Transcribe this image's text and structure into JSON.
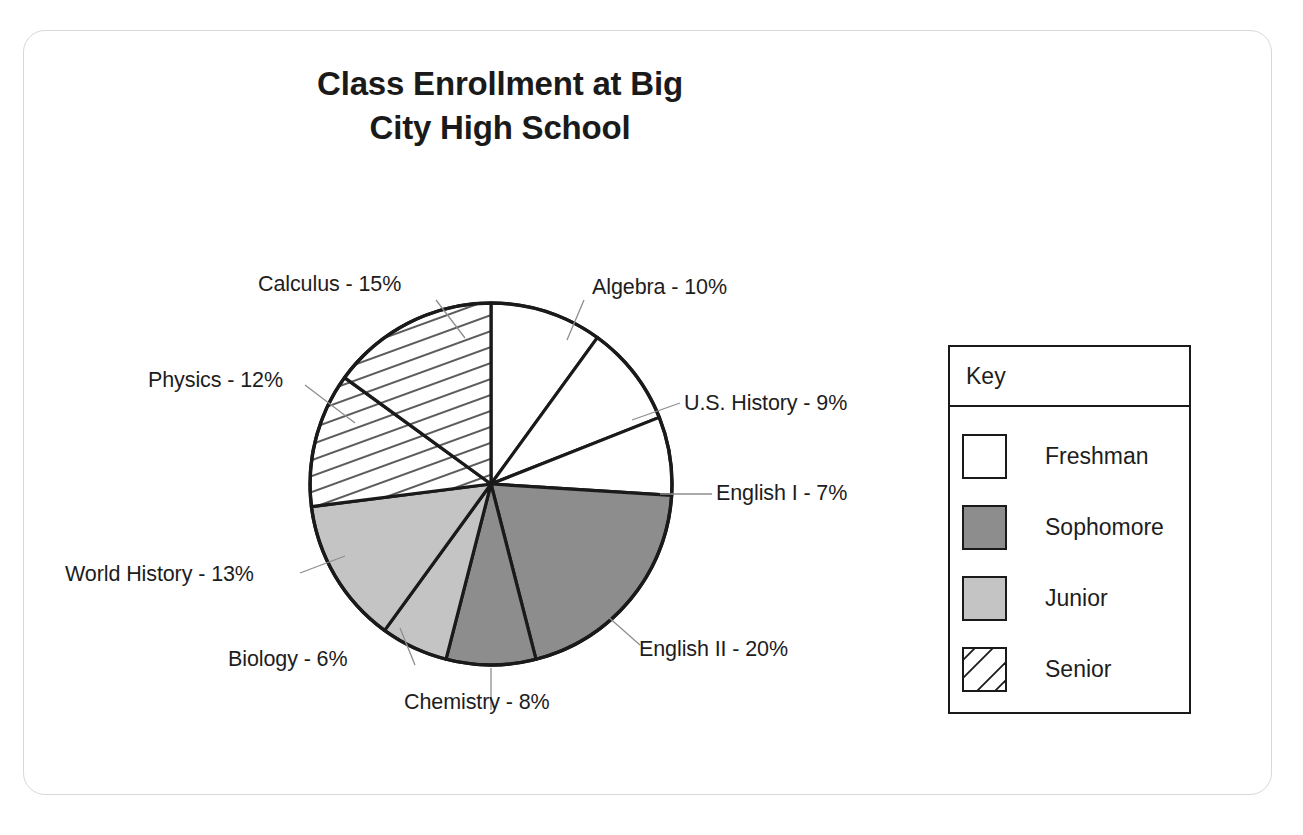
{
  "chart_data": {
    "type": "pie",
    "title": "Class Enrollment at Big\nCity High School",
    "title_line1": "Class Enrollment at Big",
    "title_line2": "City High School",
    "xlabel": "",
    "ylabel": "",
    "legend_position": "right",
    "grid": false,
    "units": "percent",
    "categories": [
      "Algebra",
      "U.S. History",
      "English I",
      "English II",
      "Chemistry",
      "Biology",
      "World History",
      "Physics",
      "Calculus"
    ],
    "values": [
      10,
      9,
      7,
      20,
      8,
      6,
      13,
      12,
      15
    ],
    "labels": [
      "Algebra - 10%",
      "U.S. History - 9%",
      "English I - 7%",
      "English II - 20%",
      "Chemistry - 8%",
      "Biology - 6%",
      "World History - 13%",
      "Physics - 12%",
      "Calculus - 15%"
    ],
    "slices": [
      {
        "name": "Algebra",
        "label": "Algebra - 10%",
        "value": 10,
        "group": "Freshman",
        "fill": "#ffffff"
      },
      {
        "name": "U.S. History",
        "label": "U.S. History - 9%",
        "value": 9,
        "group": "Freshman",
        "fill": "#ffffff"
      },
      {
        "name": "English I",
        "label": "English I - 7%",
        "value": 7,
        "group": "Freshman",
        "fill": "#ffffff"
      },
      {
        "name": "English II",
        "label": "English II - 20%",
        "value": 20,
        "group": "Sophomore",
        "fill": "#8d8d8d"
      },
      {
        "name": "Chemistry",
        "label": "Chemistry - 8%",
        "value": 8,
        "group": "Sophomore",
        "fill": "#8d8d8d"
      },
      {
        "name": "Biology",
        "label": "Biology - 6%",
        "value": 6,
        "group": "Junior",
        "fill": "#c4c4c4"
      },
      {
        "name": "World History",
        "label": "World History - 13%",
        "value": 13,
        "group": "Junior",
        "fill": "#c4c4c4"
      },
      {
        "name": "Physics",
        "label": "Physics - 12%",
        "value": 12,
        "group": "Senior",
        "fill": "hatch"
      },
      {
        "name": "Calculus",
        "label": "Calculus - 15%",
        "value": 15,
        "group": "Senior",
        "fill": "hatch"
      }
    ],
    "legend": [
      {
        "label": "Freshman",
        "swatch": "white"
      },
      {
        "label": "Sophomore",
        "swatch": "dark-gray"
      },
      {
        "label": "Junior",
        "swatch": "light-gray"
      },
      {
        "label": "Senior",
        "swatch": "diagonal-hatch"
      }
    ]
  },
  "key": {
    "header": "Key",
    "items": [
      {
        "label": "Freshman"
      },
      {
        "label": "Sophomore"
      },
      {
        "label": "Junior"
      },
      {
        "label": "Senior"
      }
    ]
  },
  "colors": {
    "freshman": "#ffffff",
    "sophomore": "#8d8d8d",
    "junior": "#c4c4c4",
    "senior": "#ffffff",
    "outline": "#1a1a1a",
    "text": "#1d1d1d",
    "frame": "#d8d8d8"
  }
}
